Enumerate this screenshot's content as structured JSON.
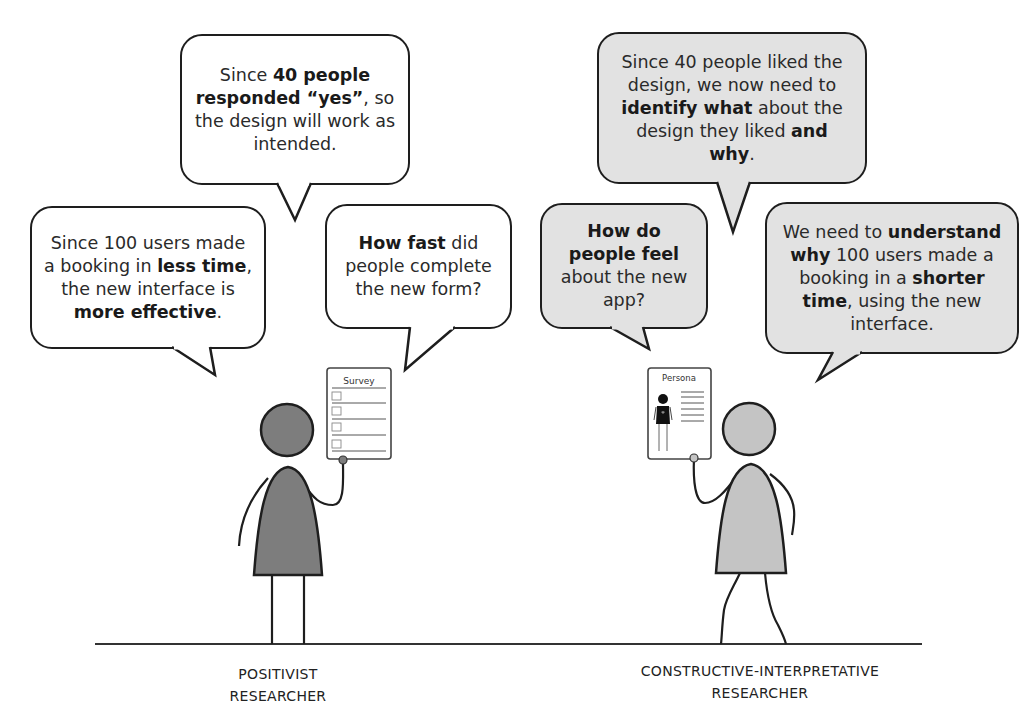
{
  "positivist": {
    "label_line1": "POSITIVIST",
    "label_line2": "RESEARCHER",
    "figure_color": "#7d7d7d",
    "clipboard_title": "Survey",
    "bubbles": {
      "top": {
        "parts": [
          {
            "t": "Since ",
            "b": false
          },
          {
            "t": "40 people responded “yes”",
            "b": true
          },
          {
            "t": ", so the design will work as intended.",
            "b": false
          }
        ]
      },
      "left": {
        "parts": [
          {
            "t": "Since 100 users made a booking in ",
            "b": false
          },
          {
            "t": "less time",
            "b": true
          },
          {
            "t": ", the new interface is ",
            "b": false
          },
          {
            "t": "more effective",
            "b": true
          },
          {
            "t": ".",
            "b": false
          }
        ]
      },
      "right": {
        "parts": [
          {
            "t": "How fast",
            "b": true
          },
          {
            "t": " did people complete the new form?",
            "b": false
          }
        ]
      }
    }
  },
  "constructive": {
    "label_line1": "CONSTRUCTIVE-INTERPRETATIVE",
    "label_line2": "RESEARCHER",
    "figure_color": "#c4c4c4",
    "clipboard_title": "Persona",
    "bubbles": {
      "top": {
        "parts": [
          {
            "t": "Since 40 people liked the design, we now need to ",
            "b": false
          },
          {
            "t": "identify what",
            "b": true
          },
          {
            "t": " about the design they liked ",
            "b": false
          },
          {
            "t": "and why",
            "b": true
          },
          {
            "t": ".",
            "b": false
          }
        ]
      },
      "left": {
        "parts": [
          {
            "t": "How do people feel",
            "b": true
          },
          {
            "t": " about the new app?",
            "b": false
          }
        ]
      },
      "right": {
        "parts": [
          {
            "t": "We need to ",
            "b": false
          },
          {
            "t": "understand why",
            "b": true
          },
          {
            "t": " 100 users made a booking in a ",
            "b": false
          },
          {
            "t": "shorter time",
            "b": true
          },
          {
            "t": ", using the new interface.",
            "b": false
          }
        ]
      }
    }
  },
  "colors": {
    "outline": "#1e1e1e",
    "grey_bubble": "#e2e2e2",
    "white_bubble": "#ffffff"
  }
}
